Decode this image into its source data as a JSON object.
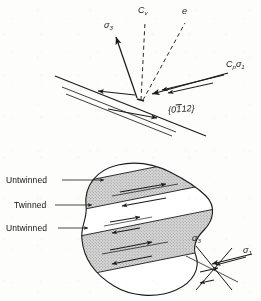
{
  "figure": {
    "kind": "scientific-line-diagram",
    "background_color": "#fdfdfc",
    "ink_color": "#1b1b1b",
    "band_fill_color": "#c9c9c9"
  },
  "upper_panel": {
    "name": "twin-plane-stress-geometry",
    "labels": {
      "sigma3": {
        "base": "σ",
        "sub": "3",
        "text": "σ3"
      },
      "cv": {
        "base": "C",
        "sub": "v",
        "text": "Cv"
      },
      "e": {
        "text": "e"
      },
      "cp_sigma1": {
        "base": "C",
        "sub": "p",
        "base2": "σ",
        "sub2": "1",
        "text": "Cpσ1"
      },
      "plane_indices": {
        "open": "{",
        "d0": "0",
        "d1_overbar": "1",
        "d2": "1",
        "d3": "2",
        "close": "}",
        "text": "{01̄2}"
      }
    },
    "elements": {
      "trace_line": "twin plane trace",
      "dashed_cv": "dashed c-axis direction Cv",
      "dashed_e": "dashed e direction",
      "arrow_sigma3": "solid arrow to sigma 3",
      "arrow_cp_sigma1": "double solid arrows to Cp sigma 1",
      "shear_arrows": "opposed shear couple arrows on plane"
    }
  },
  "lower_panel": {
    "name": "twinned-grain-sketch",
    "callouts": [
      {
        "label": "Untwinned",
        "target": "upper-light-band"
      },
      {
        "label": "Twinned",
        "target": "middle-light-band"
      },
      {
        "label": "Untwinned",
        "target": "lower-light-band"
      }
    ],
    "stress_axes": {
      "sigma3": {
        "base": "σ",
        "sub": "3",
        "text": "σ3"
      },
      "sigma1": {
        "base": "σ",
        "sub": "1",
        "text": "σ1"
      }
    },
    "bands": [
      {
        "type": "twinned",
        "fill": "stippled"
      },
      {
        "type": "untwinned",
        "fill": "white"
      },
      {
        "type": "twinned",
        "fill": "stippled"
      }
    ]
  }
}
